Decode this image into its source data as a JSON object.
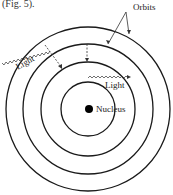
{
  "caption_fragment": "(Fig. 5).",
  "labels": {
    "orbits": "Orbits",
    "light_outer": "Light",
    "light_inner": "Light",
    "nucleus": "Nucleus"
  },
  "diagram": {
    "type": "Bohr atomic model",
    "orbit_count": 4,
    "colors": {
      "line": "#1a1a1a",
      "nucleus": "#000000",
      "text": "#222222"
    }
  }
}
